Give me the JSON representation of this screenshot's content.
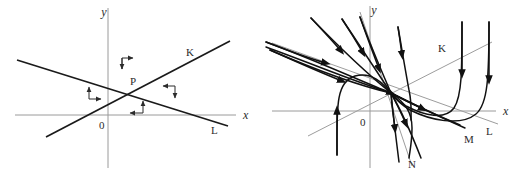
{
  "figure": {
    "width": 520,
    "height": 176,
    "background": "#ffffff",
    "line_color": "#1a1a1a",
    "axis_color": "#9a9a9a",
    "guide_color": "#9d9d9d",
    "arrow_color": "#2b2b2b"
  },
  "panels": [
    {
      "id": "left-panel",
      "name": "direction-field-panel",
      "axes": {
        "x_label": "x",
        "y_label": "y",
        "origin_label": "0"
      },
      "lines": [
        {
          "name": "line-K",
          "label": "K",
          "description": "rising straight line through P"
        },
        {
          "name": "line-L",
          "label": "L",
          "description": "falling straight line through P"
        }
      ],
      "critical_point": {
        "label": "P"
      },
      "direction_markers": [
        {
          "name": "marker-top",
          "arrows": [
            "right",
            "down"
          ]
        },
        {
          "name": "marker-left",
          "arrows": [
            "up",
            "right"
          ]
        },
        {
          "name": "marker-right",
          "arrows": [
            "left",
            "down"
          ]
        },
        {
          "name": "marker-bottom",
          "arrows": [
            "up",
            "left"
          ]
        }
      ]
    },
    {
      "id": "right-panel",
      "name": "phase-portrait-panel",
      "axes": {
        "x_label": "x",
        "y_label": "y",
        "origin_label": "0"
      },
      "lines": [
        {
          "name": "line-K",
          "label": "K",
          "description": "rising straight line through origin"
        },
        {
          "name": "line-L",
          "label": "L",
          "description": "falling straight line through origin"
        },
        {
          "name": "line-M",
          "label": "M",
          "description": "falling trajectory separatrix"
        },
        {
          "name": "line-N",
          "label": "N",
          "description": "steep descending separatrix"
        }
      ],
      "trajectories_count": 11,
      "flow": "saddle-node with trajectories converging along L and diverging along K"
    }
  ]
}
